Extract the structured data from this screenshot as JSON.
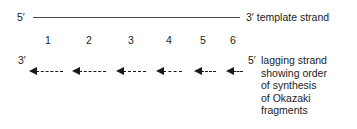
{
  "diagram": {
    "template_strand": {
      "left_end_label": "5′",
      "right_end_label": "3′",
      "name_label": "template strand"
    },
    "lagging_strand": {
      "left_end_label": "3′",
      "right_end_label": "5′"
    },
    "fragment_numbers": [
      "1",
      "2",
      "3",
      "4",
      "5",
      "6"
    ],
    "caption_lines": [
      "lagging strand",
      "showing order",
      "of synthesis",
      "of Okazaki",
      "fragments"
    ],
    "colors": {
      "ink": "#1a1a1a",
      "line": "#4a4a4a",
      "background": "#ffffff"
    }
  }
}
